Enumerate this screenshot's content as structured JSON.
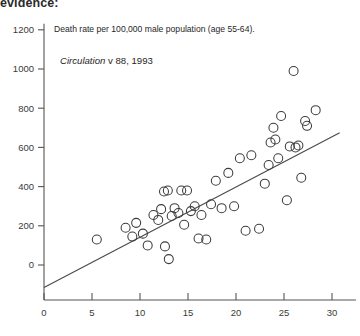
{
  "page": {
    "cut_heading": "evidence:"
  },
  "annotations": [
    {
      "id": "series-description",
      "text": "Death rate per 100,000 male population (age 55-64)."
    },
    {
      "id": "source-citation",
      "italic_text": "Circulation",
      "rest_text": " v 88, 1993"
    }
  ],
  "chart_data": {
    "type": "scatter",
    "title": "",
    "xlabel": "",
    "ylabel": "",
    "xlim": [
      0,
      31
    ],
    "ylim": [
      -150,
      1280
    ],
    "grid": false,
    "legend": null,
    "axis_color": "#555555",
    "marker": {
      "shape": "circle-open",
      "edge_color": "#3b3b3b",
      "fill": "none",
      "size_px": 9
    },
    "xticks": [
      0,
      5,
      10,
      15,
      20,
      25,
      30
    ],
    "yticks": [
      0,
      200,
      400,
      600,
      800,
      1000,
      1200
    ],
    "xtick_labels": [
      "0",
      "5",
      "10",
      "15",
      "20",
      "25",
      "30"
    ],
    "ytick_labels": [
      "0",
      "200",
      "400",
      "600",
      "800",
      "1000",
      "1200"
    ],
    "points": [
      [
        5.5,
        130
      ],
      [
        8.5,
        190
      ],
      [
        9.2,
        145
      ],
      [
        9.6,
        215
      ],
      [
        10.3,
        160
      ],
      [
        10.8,
        100
      ],
      [
        11.4,
        255
      ],
      [
        11.9,
        230
      ],
      [
        12.2,
        285
      ],
      [
        12.5,
        375
      ],
      [
        12.6,
        95
      ],
      [
        12.9,
        380
      ],
      [
        13.0,
        30
      ],
      [
        13.3,
        250
      ],
      [
        13.6,
        290
      ],
      [
        14.0,
        265
      ],
      [
        14.3,
        380
      ],
      [
        14.6,
        205
      ],
      [
        14.9,
        380
      ],
      [
        15.3,
        275
      ],
      [
        15.7,
        300
      ],
      [
        16.1,
        135
      ],
      [
        16.4,
        255
      ],
      [
        16.9,
        130
      ],
      [
        17.4,
        310
      ],
      [
        17.9,
        430
      ],
      [
        18.5,
        290
      ],
      [
        19.2,
        470
      ],
      [
        19.8,
        300
      ],
      [
        20.4,
        545
      ],
      [
        21.0,
        175
      ],
      [
        21.6,
        560
      ],
      [
        22.4,
        185
      ],
      [
        23.0,
        415
      ],
      [
        23.4,
        510
      ],
      [
        23.6,
        625
      ],
      [
        23.9,
        700
      ],
      [
        24.1,
        640
      ],
      [
        24.4,
        545
      ],
      [
        24.7,
        760
      ],
      [
        25.3,
        330
      ],
      [
        25.6,
        605
      ],
      [
        26.0,
        990
      ],
      [
        26.2,
        600
      ],
      [
        26.5,
        610
      ],
      [
        26.8,
        445
      ],
      [
        27.2,
        735
      ],
      [
        27.4,
        710
      ],
      [
        28.3,
        790
      ]
    ],
    "trend_line": {
      "type": "line",
      "x_start": 0.0,
      "y_start": -115,
      "x_end": 30.8,
      "y_end": 675,
      "color": "#4a4a4a"
    }
  }
}
